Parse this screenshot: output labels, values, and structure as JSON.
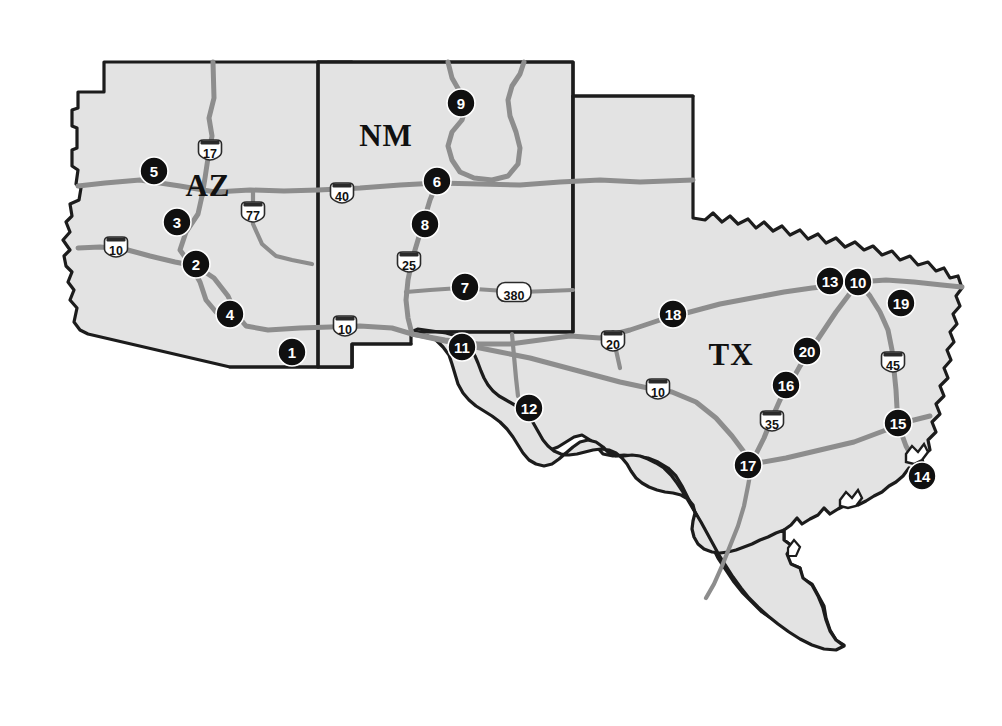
{
  "map": {
    "title": "Southwest United States reference map",
    "background_color": "#ffffff",
    "state_fill_color": "#e3e3e3",
    "state_border_color": "#1c1c1c",
    "route_color": "#8d8d8d",
    "marker_color": "#101010",
    "marker_text_color": "#ffffff",
    "state_labels": [
      {
        "name": "AZ",
        "x": 208,
        "y": 196
      },
      {
        "name": "NM",
        "x": 386,
        "y": 146
      },
      {
        "name": "TX",
        "x": 731,
        "y": 365
      }
    ],
    "markers": [
      {
        "id": "1",
        "label": "1",
        "x": 292,
        "y": 352,
        "state": "AZ"
      },
      {
        "id": "2",
        "label": "2",
        "x": 196,
        "y": 264,
        "state": "AZ"
      },
      {
        "id": "3",
        "label": "3",
        "x": 177,
        "y": 222,
        "state": "AZ"
      },
      {
        "id": "4",
        "label": "4",
        "x": 230,
        "y": 314,
        "state": "AZ"
      },
      {
        "id": "5",
        "label": "5",
        "x": 154,
        "y": 171,
        "state": "AZ"
      },
      {
        "id": "6",
        "label": "6",
        "x": 437,
        "y": 181,
        "state": "NM"
      },
      {
        "id": "7",
        "label": "7",
        "x": 465,
        "y": 287,
        "state": "NM"
      },
      {
        "id": "8",
        "label": "8",
        "x": 425,
        "y": 224,
        "state": "NM"
      },
      {
        "id": "9",
        "label": "9",
        "x": 461,
        "y": 103,
        "state": "NM"
      },
      {
        "id": "10",
        "label": "10",
        "x": 858,
        "y": 282,
        "state": "TX"
      },
      {
        "id": "11",
        "label": "11",
        "x": 462,
        "y": 347,
        "state": "TX"
      },
      {
        "id": "12",
        "label": "12",
        "x": 529,
        "y": 408,
        "state": "TX"
      },
      {
        "id": "13",
        "label": "13",
        "x": 830,
        "y": 281,
        "state": "TX"
      },
      {
        "id": "14",
        "label": "14",
        "x": 922,
        "y": 476,
        "state": "TX"
      },
      {
        "id": "15",
        "label": "15",
        "x": 898,
        "y": 423,
        "state": "TX"
      },
      {
        "id": "16",
        "label": "16",
        "x": 786,
        "y": 385,
        "state": "TX"
      },
      {
        "id": "17",
        "label": "17",
        "x": 748,
        "y": 465,
        "state": "TX"
      },
      {
        "id": "18",
        "label": "18",
        "x": 673,
        "y": 314,
        "state": "TX"
      },
      {
        "id": "19",
        "label": "19",
        "x": 901,
        "y": 303,
        "state": "TX"
      },
      {
        "id": "20",
        "label": "20",
        "x": 807,
        "y": 351,
        "state": "TX"
      }
    ],
    "interstate_shields": [
      {
        "number": "17",
        "x": 210,
        "y": 150
      },
      {
        "number": "77",
        "x": 253,
        "y": 212
      },
      {
        "number": "10",
        "x": 116,
        "y": 247
      },
      {
        "number": "40",
        "x": 342,
        "y": 193
      },
      {
        "number": "25",
        "x": 409,
        "y": 262
      },
      {
        "number": "10",
        "x": 345,
        "y": 326
      },
      {
        "number": "20",
        "x": 613,
        "y": 341
      },
      {
        "number": "10",
        "x": 658,
        "y": 389
      },
      {
        "number": "45",
        "x": 893,
        "y": 362
      },
      {
        "number": "35",
        "x": 772,
        "y": 421
      }
    ],
    "us_route_shields": [
      {
        "number": "380",
        "x": 514,
        "y": 292
      }
    ]
  }
}
